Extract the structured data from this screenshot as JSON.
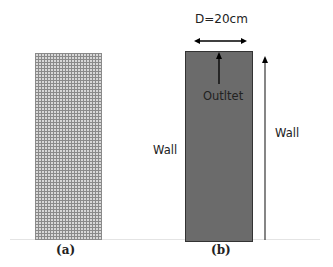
{
  "figure": {
    "panel_a": {
      "caption": "(a)",
      "description": "computational mesh"
    },
    "panel_b": {
      "caption": "(b)",
      "dimension_label": "D=20cm",
      "outlet_label": "Outltet",
      "wall_left_label": "Wall",
      "wall_right_label": "Wall"
    },
    "colors": {
      "domain_fill": "#6b6b6b",
      "mesh_lines": "#8a8a8a",
      "arrow": "#000000"
    }
  }
}
